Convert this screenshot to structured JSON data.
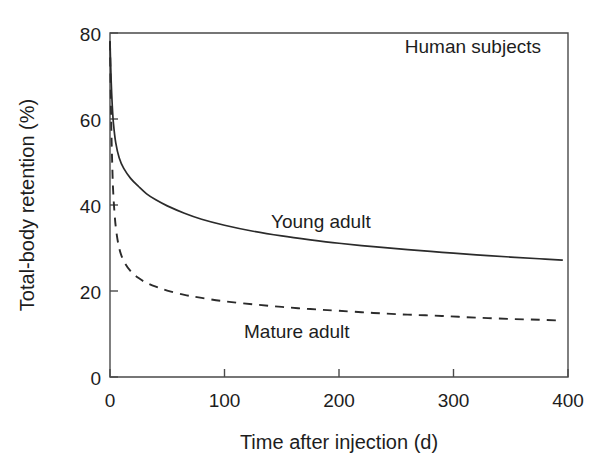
{
  "chart_data": {
    "type": "line",
    "title": "",
    "annotation": "Human subjects",
    "xlabel": "Time after injection (d)",
    "ylabel": "Total-body retention (%)",
    "xlim": [
      0,
      400
    ],
    "ylim": [
      0,
      80
    ],
    "xticks": [
      0,
      100,
      200,
      300,
      400
    ],
    "yticks": [
      0,
      20,
      40,
      60,
      80
    ],
    "xtick_labels": [
      "0",
      "100",
      "200",
      "300",
      "400"
    ],
    "ytick_labels": [
      "0",
      "20",
      "40",
      "60",
      "80"
    ],
    "grid": false,
    "legend_position": "inline-annotations",
    "series": [
      {
        "name": "Young adult",
        "style": "solid",
        "color": "#2b2b2b",
        "label_position": {
          "x": 165,
          "y": 33
        },
        "x": [
          0,
          1,
          2,
          3,
          5,
          8,
          12,
          18,
          25,
          32,
          40,
          50,
          65,
          80,
          100,
          125,
          150,
          175,
          200,
          230,
          260,
          290,
          320,
          350,
          375,
          395
        ],
        "y": [
          78,
          69,
          63,
          59,
          54.5,
          51,
          48.5,
          46.2,
          44.3,
          42.6,
          41.2,
          39.8,
          38.1,
          36.7,
          35.3,
          33.9,
          32.8,
          31.9,
          31.1,
          30.3,
          29.6,
          29.0,
          28.4,
          27.9,
          27.5,
          27.2
        ]
      },
      {
        "name": "Mature adult",
        "style": "dashed",
        "color": "#2b2b2b",
        "label_position": {
          "x": 120,
          "y": 8.5
        },
        "x": [
          0,
          1,
          2,
          3,
          5,
          8,
          12,
          18,
          25,
          32,
          40,
          50,
          65,
          80,
          100,
          125,
          150,
          175,
          200,
          230,
          260,
          290,
          320,
          350,
          375,
          395
        ],
        "y": [
          78,
          60,
          49,
          42,
          35,
          30,
          27,
          24.6,
          23.0,
          21.9,
          21.0,
          20.1,
          19.1,
          18.4,
          17.6,
          16.9,
          16.3,
          15.8,
          15.4,
          14.9,
          14.5,
          14.2,
          13.8,
          13.5,
          13.3,
          13.1
        ]
      }
    ]
  },
  "labels": {
    "annotation": "Human subjects",
    "series_young": "Young adult",
    "series_mature": "Mature adult",
    "xlabel": "Time after injection (d)",
    "ylabel": "Total-body retention (%)",
    "x_ticks": [
      "0",
      "100",
      "200",
      "300",
      "400"
    ],
    "y_ticks": [
      "80",
      "60",
      "40",
      "20",
      "0"
    ]
  },
  "colors": {
    "axis": "#4a4a4a",
    "series": "#2b2b2b",
    "background": "#ffffff",
    "text": "#1d1d1d"
  }
}
